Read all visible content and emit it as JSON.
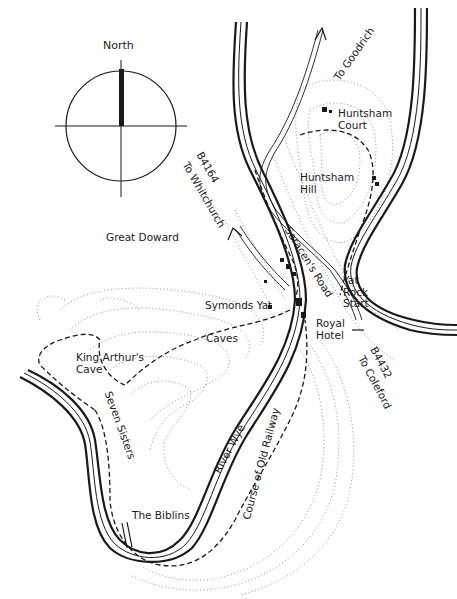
{
  "compass": {
    "label": "North"
  },
  "labels": {
    "to_goodrich": "To Goodrich",
    "huntsham_court": "Huntsham\nCourt",
    "huntsham_hill": "Huntsham\nHill",
    "b4164_road": "B4164",
    "to_whitchurch": "To Whitchurch",
    "great_doward": "Great Doward",
    "saracens_road": "Saracen's Road",
    "yat_rock_start": "Yat\nRock\nStart",
    "symonds_yat": "Symonds Yat",
    "royal_hotel": "Royal\nHotel",
    "caves": "Caves",
    "b4432_road": "B4432",
    "to_coleford": "To Coleford",
    "king_arthurs_cave": "King Arthur's\nCave",
    "seven_sisters": "Seven Sisters",
    "river_wye": "River Wye",
    "course_of_old_railway": "Course of Old Railway",
    "the_biblins": "The Biblins"
  },
  "colors": {
    "ink": "#1a1a1a",
    "contour": "#777777",
    "background": "#ffffff"
  }
}
